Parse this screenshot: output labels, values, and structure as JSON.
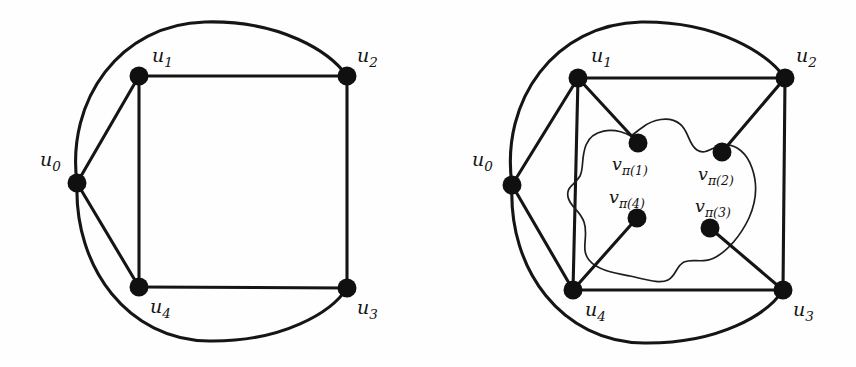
{
  "figure": {
    "background_color": "#fefefe",
    "ink_color": "#141414",
    "node_color": "#101010",
    "node_radius": 9,
    "panels": [
      {
        "id": "left-graph",
        "name": "graph-g",
        "caption": "",
        "vertices": [
          {
            "id": "u0",
            "label_base": "u",
            "label_sub": "0",
            "x": 77,
            "y": 183,
            "label_x": 40,
            "label_y": 166
          },
          {
            "id": "u1",
            "label_base": "u",
            "label_sub": "1",
            "x": 139,
            "y": 76,
            "label_x": 152,
            "label_y": 62
          },
          {
            "id": "u2",
            "label_base": "u",
            "label_sub": "2",
            "x": 347,
            "y": 76,
            "label_x": 357,
            "label_y": 62
          },
          {
            "id": "u3",
            "label_base": "u",
            "label_sub": "3",
            "x": 347,
            "y": 288,
            "label_x": 357,
            "label_y": 314
          },
          {
            "id": "u4",
            "label_base": "u",
            "label_sub": "4",
            "x": 139,
            "y": 287,
            "label_x": 150,
            "label_y": 313
          }
        ],
        "straight_edges": [
          [
            "u0",
            "u1"
          ],
          [
            "u0",
            "u4"
          ],
          [
            "u1",
            "u2"
          ],
          [
            "u1",
            "u4"
          ],
          [
            "u2",
            "u3"
          ],
          [
            "u3",
            "u4"
          ]
        ],
        "curved_edges": [
          {
            "from": "u0",
            "to": "u2",
            "side": "top"
          },
          {
            "from": "u0",
            "to": "u3",
            "side": "bottom"
          }
        ]
      },
      {
        "id": "right-graph",
        "name": "graph-g-with-inner-vertices",
        "caption": "",
        "vertices": [
          {
            "id": "u0",
            "label_base": "u",
            "label_sub": "0",
            "x": 512,
            "y": 185,
            "label_x": 472,
            "label_y": 166
          },
          {
            "id": "u1",
            "label_base": "u",
            "label_sub": "1",
            "x": 578,
            "y": 78,
            "label_x": 591,
            "label_y": 62
          },
          {
            "id": "u2",
            "label_base": "u",
            "label_sub": "2",
            "x": 785,
            "y": 78,
            "label_x": 796,
            "label_y": 62
          },
          {
            "id": "u3",
            "label_base": "u",
            "label_sub": "3",
            "x": 783,
            "y": 290,
            "label_x": 793,
            "label_y": 316
          },
          {
            "id": "u4",
            "label_base": "u",
            "label_sub": "4",
            "x": 573,
            "y": 290,
            "label_x": 585,
            "label_y": 316
          }
        ],
        "inner_vertices": [
          {
            "id": "v1",
            "label_base": "v",
            "label_sub": "π(1)",
            "x": 638,
            "y": 143,
            "label_x": 612,
            "label_y": 170
          },
          {
            "id": "v2",
            "label_base": "v",
            "label_sub": "π(2)",
            "x": 722,
            "y": 152,
            "label_x": 698,
            "label_y": 180
          },
          {
            "id": "v3",
            "label_base": "v",
            "label_sub": "π(3)",
            "x": 710,
            "y": 228,
            "label_x": 695,
            "label_y": 212
          },
          {
            "id": "v4",
            "label_base": "v",
            "label_sub": "π(4)",
            "x": 637,
            "y": 218,
            "label_x": 609,
            "label_y": 203
          }
        ],
        "straight_edges": [
          [
            "u0",
            "u1"
          ],
          [
            "u0",
            "u4"
          ],
          [
            "u1",
            "u2"
          ],
          [
            "u1",
            "u4"
          ],
          [
            "u2",
            "u3"
          ],
          [
            "u3",
            "u4"
          ]
        ],
        "curved_edges": [
          {
            "from": "u0",
            "to": "u2",
            "side": "top"
          },
          {
            "from": "u0",
            "to": "u3",
            "side": "bottom"
          }
        ],
        "inner_edges": [
          [
            "u1",
            "v1"
          ],
          [
            "u2",
            "v2"
          ],
          [
            "u3",
            "v3"
          ],
          [
            "u4",
            "v4"
          ]
        ],
        "enclosing_curve": {
          "name": "blob-outline",
          "closed": true
        }
      }
    ]
  }
}
